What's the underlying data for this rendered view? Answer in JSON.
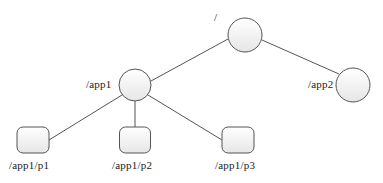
{
  "diagram": {
    "type": "tree",
    "nodes": [
      {
        "id": "root",
        "label": "/",
        "shape": "circle",
        "cx": 245,
        "cy": 35,
        "r": 17
      },
      {
        "id": "app1",
        "label": "/app1",
        "shape": "circle",
        "cx": 135,
        "cy": 85,
        "r": 16
      },
      {
        "id": "app2",
        "label": "/app2",
        "shape": "circle",
        "cx": 353,
        "cy": 85,
        "r": 17
      },
      {
        "id": "p1",
        "label": "/app1/p1",
        "shape": "rounded-rect",
        "x": 17,
        "y": 127,
        "w": 32,
        "h": 26
      },
      {
        "id": "p2",
        "label": "/app1/p2",
        "shape": "rounded-rect",
        "x": 119,
        "y": 127,
        "w": 31,
        "h": 26
      },
      {
        "id": "p3",
        "label": "/app1/p3",
        "shape": "rounded-rect",
        "x": 222,
        "y": 127,
        "w": 32,
        "h": 26
      }
    ],
    "edges": [
      {
        "from": "root",
        "to": "app1"
      },
      {
        "from": "root",
        "to": "app2"
      },
      {
        "from": "app1",
        "to": "p1"
      },
      {
        "from": "app1",
        "to": "p2"
      },
      {
        "from": "app1",
        "to": "p3"
      }
    ],
    "colors": {
      "stroke": "#555555",
      "fill_top": "#ffffff",
      "fill_bottom": "#e8e8e8",
      "text": "#222222"
    }
  },
  "labels": {
    "root": "/",
    "app1": "/app1",
    "app2": "/app2",
    "p1": "/app1/p1",
    "p2": "/app1/p2",
    "p3": "/app1/p3"
  }
}
